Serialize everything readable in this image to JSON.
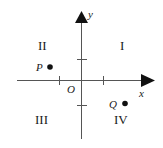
{
  "diagram": {
    "type": "coordinate-plane",
    "axes": {
      "x_label": "x",
      "y_label": "y",
      "origin_label": "O"
    },
    "quadrants": {
      "q1": "I",
      "q2": "II",
      "q3": "III",
      "q4": "IV"
    },
    "points": [
      {
        "label": "P",
        "quadrant": "II"
      },
      {
        "label": "Q",
        "quadrant": "IV"
      }
    ],
    "colors": {
      "stroke": "#333333",
      "text": "#1a1a1a",
      "background": "#ffffff"
    }
  }
}
